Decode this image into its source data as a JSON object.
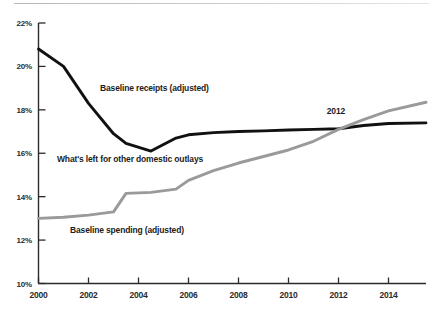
{
  "chart_data": {
    "type": "line",
    "title": "",
    "subtitle": "",
    "xlabel": "",
    "ylabel": "",
    "xlim": [
      2000,
      2015.5
    ],
    "ylim": [
      10,
      22
    ],
    "grid": false,
    "legend_position": "inline-annotations",
    "x_ticks": [
      "2000",
      "2002",
      "2004",
      "2006",
      "2008",
      "2010",
      "2012",
      "2014"
    ],
    "x_tick_values": [
      2000,
      2002,
      2004,
      2006,
      2008,
      2010,
      2012,
      2014
    ],
    "y_ticks": [
      "10%",
      "12%",
      "14%",
      "16%",
      "18%",
      "20%",
      "22%"
    ],
    "y_tick_values": [
      10,
      12,
      14,
      16,
      18,
      20,
      22
    ],
    "x": [
      2000,
      2001,
      2002,
      2003,
      2003.5,
      2004.5,
      2005.5,
      2006,
      2007,
      2008,
      2009,
      2010,
      2011,
      2012,
      2013,
      2014,
      2015.5
    ],
    "series": [
      {
        "name": "Baseline receipts (adjusted)",
        "color": "#111111",
        "values": [
          20.8,
          20.0,
          18.3,
          16.9,
          16.45,
          16.1,
          16.7,
          16.85,
          16.95,
          17.0,
          17.03,
          17.07,
          17.1,
          17.13,
          17.28,
          17.37,
          17.4
        ]
      },
      {
        "name": "Baseline spending (adjusted)",
        "color": "#9a9a9a",
        "values": [
          13.0,
          13.05,
          13.15,
          13.3,
          14.15,
          14.2,
          14.35,
          14.75,
          15.2,
          15.55,
          15.85,
          16.15,
          16.55,
          17.1,
          17.55,
          17.95,
          18.35
        ]
      }
    ],
    "annotations": [
      {
        "label": "Baseline receipts (adjusted)",
        "name": "annotation-baseline-receipts",
        "x_px": 100,
        "y_px": 83
      },
      {
        "label": "What's left for other domestic outlays",
        "name": "annotation-other-domestic-outlays",
        "x_px": 57,
        "y_px": 154
      },
      {
        "label": "Baseline spending (adjusted)",
        "name": "annotation-baseline-spending",
        "x_px": 70,
        "y_px": 225
      }
    ],
    "point_callouts": [
      {
        "label": "2012",
        "name": "callout-2012",
        "x_px": 336,
        "y_px": 106
      }
    ],
    "axis_color": "#2b2b2b",
    "background_color": "#ffffff"
  }
}
